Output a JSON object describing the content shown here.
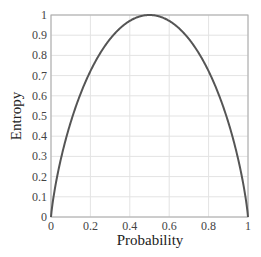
{
  "chart_data": {
    "type": "line",
    "title": "",
    "xlabel": "Probability",
    "ylabel": "Entropy",
    "xlim": [
      0,
      1
    ],
    "ylim": [
      0,
      1
    ],
    "grid": true,
    "legend": null,
    "x_ticks": [
      "0",
      "0.2",
      "0.4",
      "0.6",
      "0.8",
      "1"
    ],
    "y_ticks": [
      "0",
      "0.1",
      "0.2",
      "0.3",
      "0.4",
      "0.5",
      "0.6",
      "0.7",
      "0.8",
      "0.9",
      "1"
    ],
    "series": [
      {
        "name": "Binary entropy H(p)",
        "color": "#555555",
        "x": [
          0,
          0.01,
          0.05,
          0.1,
          0.15,
          0.2,
          0.25,
          0.3,
          0.35,
          0.4,
          0.45,
          0.5,
          0.55,
          0.6,
          0.65,
          0.7,
          0.75,
          0.8,
          0.85,
          0.9,
          0.95,
          0.99,
          1
        ],
        "y": [
          0,
          0.081,
          0.286,
          0.469,
          0.61,
          0.722,
          0.811,
          0.881,
          0.934,
          0.971,
          0.993,
          1.0,
          0.993,
          0.971,
          0.934,
          0.881,
          0.811,
          0.722,
          0.61,
          0.469,
          0.286,
          0.081,
          0
        ]
      }
    ]
  },
  "colors": {
    "curve": "#555555",
    "grid": "#e3e3e3",
    "axis": "#9a9a9a"
  }
}
